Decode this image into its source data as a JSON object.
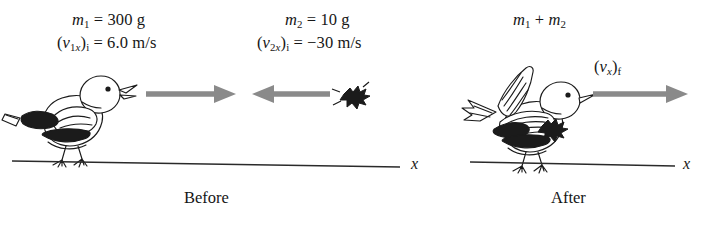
{
  "figure": {
    "background_color": "#ffffff",
    "ink_color": "#161616",
    "arrow_color": "#8a8a8a"
  },
  "before": {
    "caption": "Before",
    "axis_label": "x",
    "object1": {
      "name": "bird",
      "mass_label": "m₁ = 300 g",
      "mass_symbol": "m",
      "mass_subscript": "1",
      "mass_value": "300 g",
      "velocity_label": "(v₁ₓ)ᵢ = 6.0 m/s",
      "velocity_value": "6.0 m/s",
      "velocity_sign": "positive",
      "arrow_direction": "right",
      "arrow_icon": "arrow-right-icon"
    },
    "object2": {
      "name": "bug",
      "mass_label": "m₂ = 10 g",
      "mass_symbol": "m",
      "mass_subscript": "2",
      "mass_value": "10 g",
      "velocity_label": "(v₂ₓ)ᵢ = −30 m/s",
      "velocity_value": "−30 m/s",
      "velocity_sign": "negative",
      "arrow_direction": "left",
      "arrow_icon": "arrow-left-icon"
    }
  },
  "after": {
    "caption": "After",
    "axis_label": "x",
    "combined": {
      "name": "bird-with-bug",
      "mass_label": "m₁ + m₂",
      "velocity_label": "(vₓ)ғ",
      "arrow_direction": "right",
      "arrow_icon": "arrow-right-icon"
    }
  }
}
